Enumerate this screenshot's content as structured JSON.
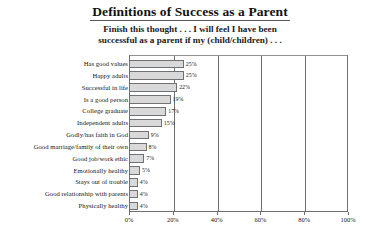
{
  "header": {
    "title": "Definitions of Success as a Parent",
    "subtitle_line1": "Finish this thought . . . I will feel I have been",
    "subtitle_line2": "successful as a parent if my (child/children) . . ."
  },
  "axis": {
    "ticks": [
      "0%",
      "20%",
      "40%",
      "60%",
      "80%",
      "100%"
    ],
    "tick_values": [
      0,
      20,
      40,
      60,
      80,
      100
    ]
  },
  "style": {
    "bar_fill": "#d9d9d9",
    "bar_stroke": "#6f7275",
    "frame_stroke": "#6b6f72",
    "text_color": "#151515"
  },
  "chart_data": {
    "type": "bar",
    "orientation": "horizontal",
    "title": "Definitions of Success as a Parent",
    "subtitle": "Finish this thought . . . I will feel I have been successful as a parent if my (child/children) . . .",
    "xlabel": "",
    "ylabel": "",
    "xlim": [
      0,
      100
    ],
    "grid": true,
    "legend": "none",
    "categories": [
      "Has good values",
      "Happy adults",
      "Successful in life",
      "Is a good person",
      "College graduate",
      "Independent adults",
      "Godly/has faith in God",
      "Good marriage/family of their own",
      "Good job/work ethic",
      "Emotionally healthy",
      "Stays out of trouble",
      "Good relationship with parents",
      "Physically healthy"
    ],
    "values": [
      25,
      25,
      22,
      19,
      17,
      15,
      9,
      8,
      7,
      5,
      4,
      4,
      4
    ],
    "value_labels": [
      "25%",
      "25%",
      "22%",
      "19%",
      "17%",
      "15%",
      "9%",
      "8%",
      "7%",
      "5%",
      "4%",
      "4%",
      "4%"
    ]
  }
}
